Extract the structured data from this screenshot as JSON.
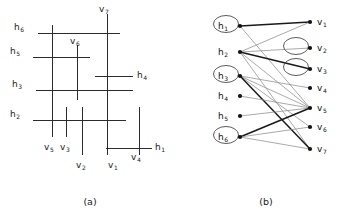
{
  "figure": {
    "caption_a": "(a)",
    "caption_b": "(b)"
  },
  "panel_a": {
    "title": "rectilinear segment arrangement",
    "horizontal_segments": [
      {
        "id": "h6",
        "label": "h",
        "sub": "6",
        "y": 33,
        "x1": 38,
        "x2": 120,
        "label_x": 14,
        "label_y": 30
      },
      {
        "id": "h5",
        "label": "h",
        "sub": "5",
        "y": 57,
        "x1": 33,
        "x2": 90,
        "label_x": 10,
        "label_y": 54
      },
      {
        "id": "h4",
        "label": "h",
        "sub": "4",
        "y": 76,
        "x1": 95,
        "x2": 133,
        "label_x": 137,
        "label_y": 78
      },
      {
        "id": "h3",
        "label": "h",
        "sub": "3",
        "y": 90,
        "x1": 36,
        "x2": 133,
        "label_x": 12,
        "label_y": 87
      },
      {
        "id": "h2",
        "label": "h",
        "sub": "2",
        "y": 120,
        "x1": 33,
        "x2": 126,
        "label_x": 10,
        "label_y": 117
      },
      {
        "id": "h1",
        "label": "h",
        "sub": "1",
        "y": 148,
        "x1": 106,
        "x2": 152,
        "label_x": 155,
        "label_y": 150
      }
    ],
    "vertical_segments": [
      {
        "id": "v7",
        "label": "v",
        "sub": "7",
        "x": 107,
        "y1": 14,
        "y2": 130,
        "label_x": 99,
        "label_y": 12
      },
      {
        "id": "v6",
        "label": "v",
        "sub": "6",
        "x": 77,
        "y1": 45,
        "y2": 100,
        "label_x": 70,
        "label_y": 44
      },
      {
        "id": "v5",
        "label": "v",
        "sub": "5",
        "x": 52,
        "y1": 25,
        "y2": 137,
        "label_x": 44,
        "label_y": 150
      },
      {
        "id": "v3",
        "label": "v",
        "sub": "3",
        "x": 66,
        "y1": 107,
        "y2": 137,
        "label_x": 60,
        "label_y": 150
      },
      {
        "id": "v2",
        "label": "v",
        "sub": "2",
        "x": 82,
        "y1": 107,
        "y2": 155,
        "label_x": 76,
        "label_y": 168
      },
      {
        "id": "v1",
        "label": "v",
        "sub": "1",
        "x": 107,
        "y1": 14,
        "y2": 155,
        "label_x": 108,
        "label_y": 168
      },
      {
        "id": "v4",
        "label": "v",
        "sub": "4",
        "x": 139,
        "y1": 107,
        "y2": 155,
        "label_x": 131,
        "label_y": 160
      }
    ]
  },
  "panel_b": {
    "title": "bipartite intersection graph",
    "h_nodes": [
      {
        "id": "h1",
        "label": "h",
        "sub": "1",
        "x": 60,
        "y": 26,
        "circled": true
      },
      {
        "id": "h2",
        "label": "h",
        "sub": "2",
        "x": 60,
        "y": 52,
        "circled": false
      },
      {
        "id": "h3",
        "label": "h",
        "sub": "3",
        "x": 60,
        "y": 76,
        "circled": true
      },
      {
        "id": "h4",
        "label": "h",
        "sub": "4",
        "x": 60,
        "y": 96,
        "circled": false
      },
      {
        "id": "h5",
        "label": "h",
        "sub": "5",
        "x": 60,
        "y": 116,
        "circled": false
      },
      {
        "id": "h6",
        "label": "h",
        "sub": "6",
        "x": 60,
        "y": 137,
        "circled": true
      }
    ],
    "v_nodes": [
      {
        "id": "v1",
        "label": "v",
        "sub": "1",
        "x": 130,
        "y": 22,
        "circled": false
      },
      {
        "id": "v2",
        "label": "v",
        "sub": "2",
        "x": 130,
        "y": 48,
        "circled": true
      },
      {
        "id": "v3",
        "label": "v",
        "sub": "3",
        "x": 130,
        "y": 69,
        "circled": true
      },
      {
        "id": "v4",
        "label": "v",
        "sub": "4",
        "x": 130,
        "y": 88,
        "circled": false
      },
      {
        "id": "v5",
        "label": "v",
        "sub": "5",
        "x": 130,
        "y": 108,
        "circled": false
      },
      {
        "id": "v6",
        "label": "v",
        "sub": "6",
        "x": 130,
        "y": 127,
        "circled": false
      },
      {
        "id": "v7",
        "label": "v",
        "sub": "7",
        "x": 130,
        "y": 149,
        "circled": false
      }
    ],
    "edges": [
      {
        "from": "h1",
        "to": "v1",
        "weight": "thick"
      },
      {
        "from": "h1",
        "to": "v5",
        "weight": "thin"
      },
      {
        "from": "h2",
        "to": "v1",
        "weight": "thin"
      },
      {
        "from": "h2",
        "to": "v2",
        "weight": "thin"
      },
      {
        "from": "h2",
        "to": "v3",
        "weight": "thick"
      },
      {
        "from": "h2",
        "to": "v5",
        "weight": "thin"
      },
      {
        "from": "h2",
        "to": "v7",
        "weight": "thin"
      },
      {
        "from": "h3",
        "to": "v4",
        "weight": "thin"
      },
      {
        "from": "h3",
        "to": "v5",
        "weight": "thin"
      },
      {
        "from": "h3",
        "to": "v6",
        "weight": "thin"
      },
      {
        "from": "h3",
        "to": "v7",
        "weight": "thick"
      },
      {
        "from": "h4",
        "to": "v5",
        "weight": "thin"
      },
      {
        "from": "h5",
        "to": "v5",
        "weight": "thin"
      },
      {
        "from": "h6",
        "to": "v5",
        "weight": "thick"
      },
      {
        "from": "h6",
        "to": "v6",
        "weight": "thin"
      },
      {
        "from": "h6",
        "to": "v7",
        "weight": "thin"
      }
    ]
  }
}
